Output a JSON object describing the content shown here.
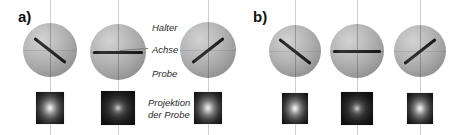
{
  "figure": {
    "background_color": "#ffffff",
    "width": 471,
    "height": 135,
    "style": "grayscale scientific schematic"
  },
  "panels": [
    {
      "id": "a",
      "letter": "a)",
      "letter_x": 18,
      "letter_y": 8,
      "spheres": [
        {
          "cx": 50,
          "cy": 50,
          "r": 27,
          "rod_angle_deg": 38,
          "rod_length": 40,
          "rod_kind": "tilted"
        },
        {
          "cx": 118,
          "cy": 52,
          "r": 28,
          "rod_angle_deg": 0,
          "rod_length": 50,
          "rod_kind": "horizontal"
        },
        {
          "cx": 208,
          "cy": 50,
          "r": 28,
          "rod_angle_deg": -38,
          "rod_length": 40,
          "rod_kind": "tilted"
        }
      ],
      "projections": [
        {
          "cx": 50,
          "cy": 108,
          "w": 28,
          "h": 32,
          "tone": "light"
        },
        {
          "cx": 118,
          "cy": 108,
          "w": 34,
          "h": 34,
          "tone": "dark"
        },
        {
          "cx": 208,
          "cy": 108,
          "w": 28,
          "h": 32,
          "tone": "light"
        }
      ],
      "axis_lines_x": [
        50,
        118,
        208
      ]
    },
    {
      "id": "b",
      "letter": "b)",
      "letter_x": 253,
      "letter_y": 8,
      "spheres": [
        {
          "cx": 295,
          "cy": 51,
          "r": 26,
          "rod_angle_deg": 38,
          "rod_length": 40,
          "rod_kind": "tilted"
        },
        {
          "cx": 357,
          "cy": 51,
          "r": 27,
          "rod_angle_deg": 0,
          "rod_length": 48,
          "rod_kind": "horizontal"
        },
        {
          "cx": 420,
          "cy": 51,
          "r": 26,
          "rod_angle_deg": -38,
          "rod_length": 40,
          "rod_kind": "tilted"
        }
      ],
      "projections": [
        {
          "cx": 295,
          "cy": 108,
          "w": 26,
          "h": 31,
          "tone": "light"
        },
        {
          "cx": 357,
          "cy": 108,
          "w": 32,
          "h": 33,
          "tone": "dark"
        },
        {
          "cx": 420,
          "cy": 108,
          "w": 26,
          "h": 31,
          "tone": "light"
        }
      ],
      "axis_lines_x": [
        295,
        357,
        420
      ]
    }
  ],
  "annotations": {
    "halter": {
      "text": "Halter",
      "x": 152,
      "y": 22
    },
    "achse": {
      "text": "Achse",
      "x": 152,
      "y": 44
    },
    "probe": {
      "text": "Probe",
      "x": 152,
      "y": 68
    },
    "projektion": {
      "line1": "Projektion",
      "line2": "der Probe",
      "x": 148,
      "y": 97
    }
  },
  "leader_lines": [
    {
      "name": "achse-leader",
      "x1": 148,
      "y1": 48,
      "x2": 120,
      "y2": 50
    }
  ],
  "colors": {
    "sphere_light": "#d2d2d2",
    "sphere_mid": "#a2a2a2",
    "sphere_dark": "#868686",
    "rod": "#1a1a1a",
    "axis_guide": "#cfcfcf",
    "label_text": "#2b2b2b",
    "panel_letter": "#101010",
    "projection_center": "#f2f2f2",
    "projection_edge": "#101010"
  }
}
